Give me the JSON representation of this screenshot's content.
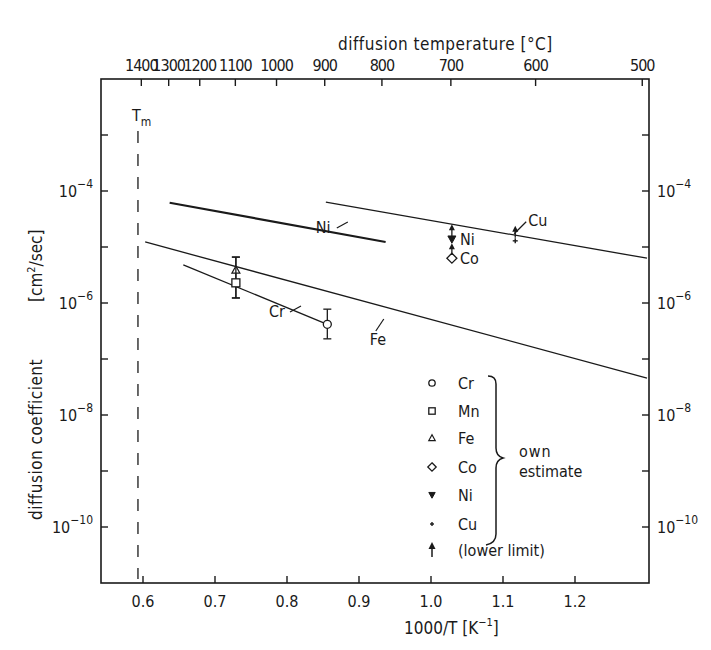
{
  "chart_data": {
    "type": "line",
    "title": "",
    "xlabel": "1000/T [K^-1]",
    "ylabel": "diffusion coefficient [cm^2/sec]",
    "top_xlabel": "diffusion temperature [°C]",
    "x_scale": "linear",
    "y_scale": "log",
    "xlim": [
      0.54,
      1.29
    ],
    "ylim": [
      1e-11,
      0.01
    ],
    "grid": false,
    "x_ticks": [
      "0.6",
      "0.7",
      "0.8",
      "0.9",
      "1.0",
      "1.1",
      "1.2"
    ],
    "x_tick_values": [
      0.6,
      0.7,
      0.8,
      0.9,
      1.0,
      1.1,
      1.2
    ],
    "top_x_ticks": [
      "1400",
      "1300",
      "1200",
      "1100",
      "1000",
      "900",
      "800",
      "700",
      "600",
      "500"
    ],
    "top_x_tick_values_celsius": [
      1400,
      1300,
      1200,
      1100,
      1000,
      900,
      800,
      700,
      600,
      500
    ],
    "y_tick_labels": [
      {
        "exp": -4,
        "label_base": "10",
        "label_exp": "−4"
      },
      {
        "exp": -6,
        "label_base": "10",
        "label_exp": "−6"
      },
      {
        "exp": -8,
        "label_base": "10",
        "label_exp": "−8"
      },
      {
        "exp": -10,
        "label_base": "10",
        "label_exp": "−10"
      }
    ],
    "y_minor_tick_exponents": [
      -3,
      -5,
      -7,
      -9
    ],
    "series": [
      {
        "name": "Ni",
        "kind": "line",
        "thick": true,
        "x": [
          0.637,
          0.937
        ],
        "log10_y": [
          -4.21,
          -4.91
        ],
        "label_at": [
          0.84,
          -4.75
        ]
      },
      {
        "name": "Cu",
        "kind": "line",
        "thick": false,
        "x": [
          0.854,
          1.3
        ],
        "log10_y": [
          -4.2,
          -5.2
        ],
        "label_at": [
          1.135,
          -4.62
        ]
      },
      {
        "name": "Fe",
        "kind": "line",
        "thick": false,
        "x": [
          0.603,
          1.3
        ],
        "log10_y": [
          -4.91,
          -7.34
        ],
        "label_at": [
          0.915,
          -6.75
        ]
      },
      {
        "name": "Cr",
        "kind": "line",
        "thick": false,
        "x": [
          0.656,
          0.856
        ],
        "log10_y": [
          -5.32,
          -6.38
        ],
        "label_at": [
          0.775,
          -6.25
        ]
      }
    ],
    "points": [
      {
        "element": "Fe",
        "marker": "triangle-up",
        "x": 0.729,
        "log10_y": -5.41,
        "err": [
          -5.18,
          -5.91
        ]
      },
      {
        "element": "Mn",
        "marker": "square",
        "x": 0.729,
        "log10_y": -5.64,
        "err": [
          -5.18,
          -5.91
        ]
      },
      {
        "element": "Cr",
        "marker": "circle",
        "x": 0.856,
        "log10_y": -6.38,
        "err": [
          -6.11,
          -6.64
        ]
      },
      {
        "element": "Ni",
        "marker": "triangle-down",
        "x": 1.029,
        "log10_y": -4.86,
        "lower_limit": true,
        "label": "Ni"
      },
      {
        "element": "Co",
        "marker": "diamond",
        "x": 1.029,
        "log10_y": -5.2,
        "lower_limit": true,
        "label": "Co"
      },
      {
        "element": "Cu",
        "marker": "plus",
        "x": 1.117,
        "log10_y": -4.89,
        "lower_limit": true
      }
    ],
    "annotations": [
      {
        "text": "T",
        "sub": "m",
        "type": "vline-dashed",
        "x": 0.593
      }
    ],
    "legend": {
      "position": "lower-right-inside",
      "entries": [
        {
          "marker": "circle",
          "label": "Cr"
        },
        {
          "marker": "square",
          "label": "Mn"
        },
        {
          "marker": "triangle-up",
          "label": "Fe"
        },
        {
          "marker": "diamond",
          "label": "Co"
        },
        {
          "marker": "triangle-down",
          "label": "Ni"
        },
        {
          "marker": "plus",
          "label": "Cu"
        },
        {
          "marker": "arrow-up",
          "label": "(lower limit)"
        }
      ],
      "brace_label_line1": "own",
      "brace_label_line2": "estimate"
    }
  }
}
